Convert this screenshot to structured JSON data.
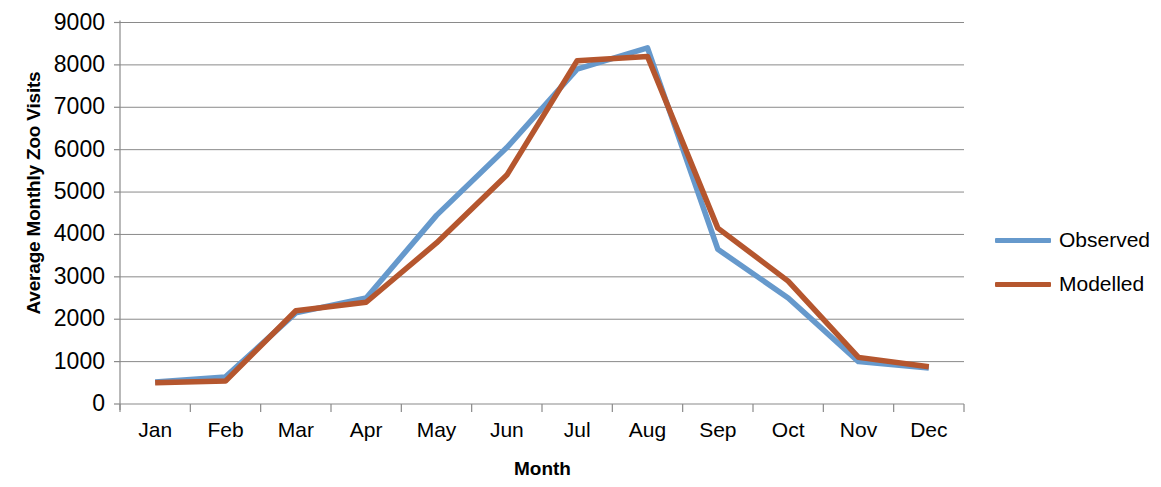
{
  "chart_data": {
    "type": "line",
    "title": "",
    "xlabel": "Month",
    "ylabel": "Average Monthly Zoo Visits",
    "categories": [
      "Jan",
      "Feb",
      "Mar",
      "Apr",
      "May",
      "Jun",
      "Jul",
      "Aug",
      "Sep",
      "Oct",
      "Nov",
      "Dec"
    ],
    "ylim": [
      0,
      9000
    ],
    "ytick_labels": [
      "0",
      "1000",
      "2000",
      "3000",
      "4000",
      "5000",
      "6000",
      "7000",
      "8000",
      "9000"
    ],
    "ytick_values": [
      0,
      1000,
      2000,
      3000,
      4000,
      5000,
      6000,
      7000,
      8000,
      9000
    ],
    "grid": "horizontal",
    "legend_position": "right",
    "series": [
      {
        "name": "Observed",
        "color": "#6699cc",
        "values": [
          520,
          640,
          2150,
          2500,
          4450,
          6050,
          7900,
          8400,
          3650,
          2500,
          1000,
          850
        ]
      },
      {
        "name": "Modelled",
        "color": "#b5562e",
        "values": [
          500,
          540,
          2200,
          2400,
          3800,
          5400,
          8100,
          8200,
          4150,
          2900,
          1100,
          880
        ]
      }
    ]
  },
  "legend": {
    "items": [
      {
        "label": "Observed"
      },
      {
        "label": "Modelled"
      }
    ]
  }
}
